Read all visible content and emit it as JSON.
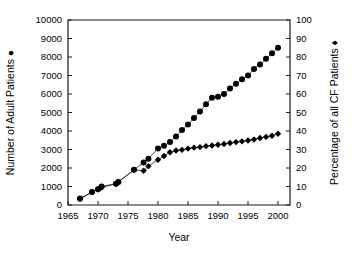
{
  "chart_data": {
    "type": "line",
    "title": "",
    "xlabel": "Year",
    "xlim": [
      1965,
      2002
    ],
    "xticks": [
      1965,
      1970,
      1975,
      1980,
      1985,
      1990,
      1995,
      2000
    ],
    "xticklabels": [
      "1965",
      "1970",
      "1975",
      "1980",
      "1985",
      "1990",
      "1995",
      "2000"
    ],
    "grid": false,
    "legend_position": "axis-labels",
    "axes": [
      {
        "id": "left",
        "label": "Number of Adult Patients",
        "marker": "circle",
        "marker_glyph": "●",
        "ylim": [
          0,
          10000
        ],
        "yticks": [
          0,
          1000,
          2000,
          3000,
          4000,
          5000,
          6000,
          7000,
          8000,
          9000,
          10000
        ],
        "yticklabels": [
          "0",
          "1000",
          "2000",
          "3000",
          "4000",
          "5000",
          "6000",
          "7000",
          "8000",
          "9000",
          "10000"
        ]
      },
      {
        "id": "right",
        "label": "Percentage of all CF Patients",
        "marker": "diamond",
        "marker_glyph": "♦",
        "ylim": [
          0,
          100
        ],
        "yticks": [
          0,
          10,
          20,
          30,
          40,
          50,
          60,
          70,
          80,
          90,
          100
        ],
        "yticklabels": [
          "0",
          "10",
          "20",
          "30",
          "40",
          "50",
          "60",
          "70",
          "80",
          "90",
          "100"
        ]
      }
    ],
    "series": [
      {
        "name": "Number of Adult Patients",
        "axis": "left",
        "marker": "circle",
        "x": [
          1967,
          1969,
          1970,
          1970.6,
          1973,
          1973.4,
          1976,
          1977.6,
          1978.4,
          1980,
          1981,
          1982,
          1983,
          1984,
          1985,
          1986,
          1987,
          1988,
          1989,
          1990,
          1991,
          1992,
          1993,
          1994,
          1995,
          1996,
          1997,
          1998,
          1999,
          2000
        ],
        "values": [
          350,
          700,
          850,
          1000,
          1150,
          1250,
          1900,
          2300,
          2500,
          3050,
          3200,
          3400,
          3700,
          4050,
          4350,
          4700,
          5050,
          5450,
          5800,
          5850,
          6000,
          6300,
          6550,
          6800,
          7000,
          7350,
          7600,
          7900,
          8200,
          8500
        ]
      },
      {
        "name": "Percentage of all CF Patients",
        "axis": "right",
        "marker": "diamond",
        "x": [
          1967,
          1969,
          1970,
          1970.6,
          1973,
          1973.4,
          1976,
          1977.6,
          1978.4,
          1980,
          1981,
          1982,
          1983,
          1984,
          1985,
          1986,
          1987,
          1988,
          1989,
          1990,
          1991,
          1992,
          1993,
          1994,
          1995,
          1996,
          1997,
          1998,
          1999,
          2000
        ],
        "values": [
          3.2,
          7.0,
          8.5,
          9.5,
          11.5,
          12.5,
          19.0,
          18.5,
          21.0,
          24.5,
          26.5,
          28.5,
          29.5,
          29.8,
          30.5,
          31.0,
          31.3,
          31.8,
          32.2,
          32.6,
          33.0,
          33.5,
          34.0,
          34.4,
          34.9,
          35.4,
          36.2,
          36.8,
          37.4,
          38.5
        ]
      }
    ]
  }
}
